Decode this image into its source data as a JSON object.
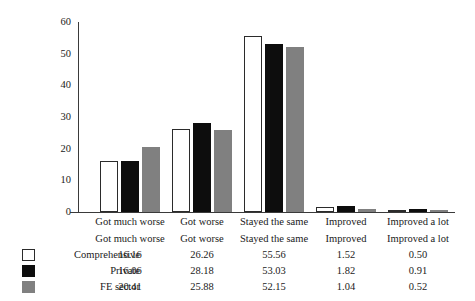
{
  "chart_data": {
    "type": "bar",
    "title": "",
    "xlabel": "",
    "ylabel": "Percentage",
    "ylim": [
      0,
      60
    ],
    "yticks": [
      0,
      10,
      20,
      30,
      40,
      50,
      60
    ],
    "grid": false,
    "legend_position": "bottom-left-table",
    "categories": [
      "Got much worse",
      "Got worse",
      "Stayed the same",
      "Improved",
      "Improved a lot"
    ],
    "series": [
      {
        "name": "Comprehensive",
        "color": "#ffffff",
        "values": [
          16.16,
          26.26,
          55.56,
          1.52,
          0.5
        ],
        "labels": [
          "16.16",
          "26.26",
          "55.56",
          "1.52",
          "0.50"
        ]
      },
      {
        "name": "Private",
        "color": "#0d0d0d",
        "values": [
          16.06,
          28.18,
          53.03,
          1.82,
          0.91
        ],
        "labels": [
          "16.06",
          "28.18",
          "53.03",
          "1.82",
          "0.91"
        ]
      },
      {
        "name": "FE sector",
        "color": "#808080",
        "values": [
          20.41,
          25.88,
          52.15,
          1.04,
          0.52
        ],
        "labels": [
          "20.41",
          "25.88",
          "52.15",
          "1.04",
          "0.52"
        ]
      }
    ],
    "axis": {
      "tick_labels": [
        "0",
        "10",
        "20",
        "30",
        "40",
        "50",
        "60"
      ]
    }
  },
  "colors": {
    "axis": "#3a3a3a",
    "text": "#1a1a1a",
    "series_comprehensive": "#ffffff",
    "series_private": "#0d0d0d",
    "series_fe_sector": "#808080"
  }
}
